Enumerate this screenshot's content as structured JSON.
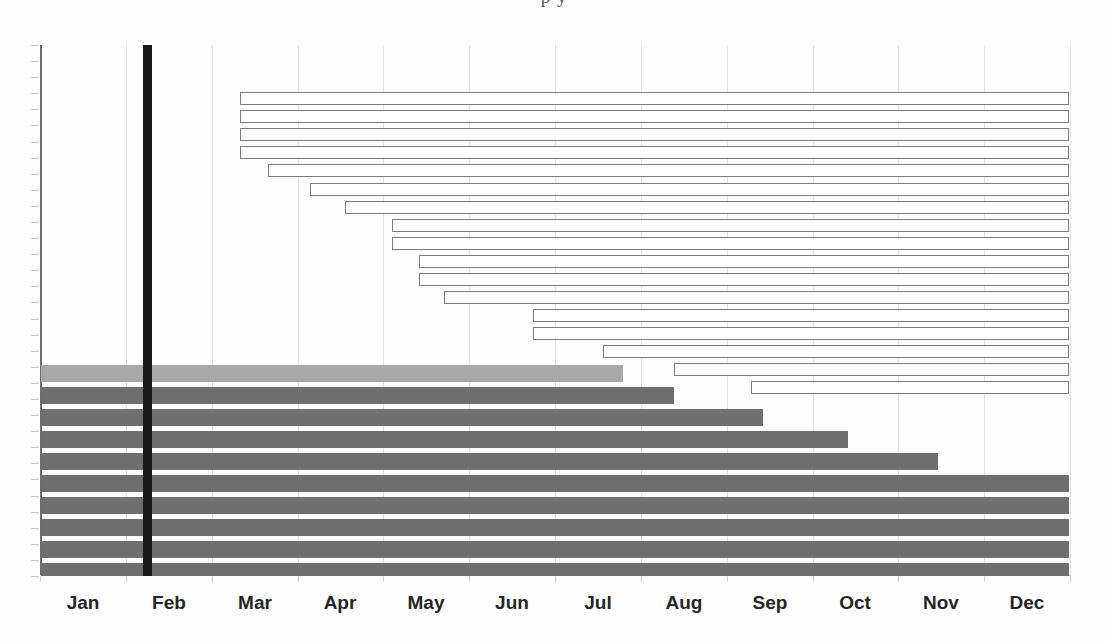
{
  "page": {
    "width": 1108,
    "height": 642,
    "background": "#fefefe",
    "top_text_fragment": "p y"
  },
  "axis": {
    "x_label": "",
    "y_label": "",
    "axis_color": "#6d6d6d",
    "grid_color": "#e2e2e2",
    "plot_left": 40,
    "plot_top": 45,
    "plot_width": 1030,
    "plot_height": 531
  },
  "marker": {
    "name": "status-date-marker",
    "label": "",
    "color": "#191919",
    "month_value": 0.9,
    "x_px": 143,
    "width_px": 9
  },
  "legend": {
    "visible": false,
    "entries": [
      {
        "label": "Planned (baseline)",
        "style": "hollow",
        "color": "#7d7d7d"
      },
      {
        "label": "Actual / progress",
        "style": "filled",
        "color": "#6f6f6f"
      },
      {
        "label": "Completed",
        "style": "filled",
        "color": "#a8a8a8"
      }
    ]
  },
  "chart_data": {
    "type": "bar",
    "orientation": "horizontal",
    "title": "",
    "subtitle": "",
    "xlabel": "",
    "ylabel": "",
    "grid": true,
    "legend_position": "none",
    "xlim": [
      0,
      12
    ],
    "x_tick_labels": [
      "Jan",
      "Feb",
      "Mar",
      "Apr",
      "May",
      "Jun",
      "Jul",
      "Aug",
      "Sep",
      "Oct",
      "Nov",
      "Dec"
    ],
    "x_tick_values": [
      0.5,
      1.5,
      2.5,
      3.5,
      4.5,
      5.5,
      6.5,
      7.5,
      8.5,
      9.5,
      10.5,
      11.5
    ],
    "ylim": [
      0,
      32
    ],
    "y_tick_labels": [],
    "series": [
      {
        "name": "Planned (baseline)",
        "style": "hollow",
        "fill": "#ffffff",
        "stroke": "#7d7d7d",
        "bars": [
          {
            "index": 1,
            "start": 2.33,
            "end": 12.0,
            "duration": 9.67
          },
          {
            "index": 2,
            "start": 2.33,
            "end": 12.0,
            "duration": 9.67
          },
          {
            "index": 3,
            "start": 2.33,
            "end": 12.0,
            "duration": 9.67
          },
          {
            "index": 4,
            "start": 2.33,
            "end": 12.0,
            "duration": 9.67
          },
          {
            "index": 5,
            "start": 2.66,
            "end": 12.0,
            "duration": 9.34
          },
          {
            "index": 6,
            "start": 3.15,
            "end": 12.0,
            "duration": 8.85
          },
          {
            "index": 7,
            "start": 3.56,
            "end": 12.0,
            "duration": 8.44
          },
          {
            "index": 8,
            "start": 4.11,
            "end": 12.0,
            "duration": 7.89
          },
          {
            "index": 9,
            "start": 4.11,
            "end": 12.0,
            "duration": 7.89
          },
          {
            "index": 10,
            "start": 4.42,
            "end": 12.0,
            "duration": 7.58
          },
          {
            "index": 11,
            "start": 4.42,
            "end": 12.0,
            "duration": 7.58
          },
          {
            "index": 12,
            "start": 4.72,
            "end": 12.0,
            "duration": 7.28
          },
          {
            "index": 13,
            "start": 5.76,
            "end": 12.0,
            "duration": 6.24
          },
          {
            "index": 14,
            "start": 5.76,
            "end": 12.0,
            "duration": 6.24
          },
          {
            "index": 15,
            "start": 6.58,
            "end": 12.0,
            "duration": 5.42
          },
          {
            "index": 16,
            "start": 7.4,
            "end": 12.0,
            "duration": 4.6
          },
          {
            "index": 17,
            "start": 8.3,
            "end": 12.0,
            "duration": 3.7
          }
        ]
      },
      {
        "name": "Actual / progress",
        "style": "filled",
        "fill": "#6f6f6f",
        "bars": [
          {
            "index": 1,
            "start": 0.0,
            "end": 6.72,
            "duration": 6.72,
            "color": "#a8a8a8"
          },
          {
            "index": 2,
            "start": 0.0,
            "end": 7.32,
            "duration": 7.32,
            "color": "#6f6f6f"
          },
          {
            "index": 3,
            "start": 0.0,
            "end": 8.35,
            "duration": 8.35,
            "color": "#6f6f6f"
          },
          {
            "index": 4,
            "start": 0.0,
            "end": 9.34,
            "duration": 9.34,
            "color": "#6f6f6f"
          },
          {
            "index": 5,
            "start": 0.0,
            "end": 10.39,
            "duration": 10.39,
            "color": "#6f6f6f"
          },
          {
            "index": 6,
            "start": 0.0,
            "end": 12.0,
            "duration": 12.0,
            "color": "#6f6f6f"
          },
          {
            "index": 7,
            "start": 0.0,
            "end": 12.0,
            "duration": 12.0,
            "color": "#6f6f6f"
          },
          {
            "index": 8,
            "start": 0.0,
            "end": 12.0,
            "duration": 12.0,
            "color": "#6f6f6f"
          },
          {
            "index": 9,
            "start": 0.0,
            "end": 12.0,
            "duration": 12.0,
            "color": "#6f6f6f"
          },
          {
            "index": 10,
            "start": 0.0,
            "end": 12.0,
            "duration": 12.0,
            "color": "#6f6f6f"
          },
          {
            "index": 11,
            "start": 0.0,
            "end": 12.0,
            "duration": 12.0,
            "color": "#6f6f6f"
          },
          {
            "index": 12,
            "start": 0.0,
            "end": 12.0,
            "duration": 12.0,
            "color": "#6f6f6f"
          },
          {
            "index": 13,
            "start": 0.0,
            "end": 12.0,
            "duration": 12.0,
            "color": "#6f6f6f"
          },
          {
            "index": 14,
            "start": 0.0,
            "end": 12.0,
            "duration": 12.0,
            "color": "#6f6f6f"
          },
          {
            "index": 15,
            "start": 0.0,
            "end": 12.0,
            "duration": 12.0,
            "color": "#6f6f6f"
          },
          {
            "index": 16,
            "start": 0.0,
            "end": 12.0,
            "duration": 12.0,
            "color": "#6f6f6f"
          }
        ]
      }
    ]
  },
  "geometry": {
    "hollow_bars_px": [
      {
        "x": 240,
        "y": 92,
        "w": 829,
        "h": 13
      },
      {
        "x": 240,
        "y": 110,
        "w": 829,
        "h": 13
      },
      {
        "x": 240,
        "y": 128,
        "w": 829,
        "h": 13
      },
      {
        "x": 240,
        "y": 146,
        "w": 829,
        "h": 13
      },
      {
        "x": 268,
        "y": 164,
        "w": 801,
        "h": 13
      },
      {
        "x": 310,
        "y": 183,
        "w": 759,
        "h": 13
      },
      {
        "x": 345,
        "y": 201,
        "w": 724,
        "h": 13
      },
      {
        "x": 392,
        "y": 219,
        "w": 677,
        "h": 13
      },
      {
        "x": 392,
        "y": 237,
        "w": 677,
        "h": 13
      },
      {
        "x": 419,
        "y": 255,
        "w": 650,
        "h": 13
      },
      {
        "x": 419,
        "y": 273,
        "w": 650,
        "h": 13
      },
      {
        "x": 444,
        "y": 291,
        "w": 625,
        "h": 13
      },
      {
        "x": 533,
        "y": 309,
        "w": 536,
        "h": 13
      },
      {
        "x": 533,
        "y": 327,
        "w": 536,
        "h": 13
      },
      {
        "x": 603,
        "y": 345,
        "w": 466,
        "h": 13
      },
      {
        "x": 674,
        "y": 363,
        "w": 395,
        "h": 13
      },
      {
        "x": 751,
        "y": 381,
        "w": 318,
        "h": 13
      }
    ],
    "filled_bars_px": [
      {
        "x": 41,
        "y": 365,
        "w": 582,
        "h": 17,
        "color": "#a8a8a8"
      },
      {
        "x": 41,
        "y": 387,
        "w": 633,
        "h": 17,
        "color": "#6f6f6f"
      },
      {
        "x": 41,
        "y": 409,
        "w": 722,
        "h": 17,
        "color": "#6f6f6f"
      },
      {
        "x": 41,
        "y": 431,
        "w": 807,
        "h": 17,
        "color": "#6f6f6f"
      },
      {
        "x": 41,
        "y": 453,
        "w": 897,
        "h": 17,
        "color": "#6f6f6f"
      },
      {
        "x": 41,
        "y": 475,
        "w": 1028,
        "h": 17,
        "color": "#6f6f6f"
      },
      {
        "x": 41,
        "y": 497,
        "w": 1028,
        "h": 17,
        "color": "#6f6f6f"
      },
      {
        "x": 41,
        "y": 519,
        "w": 1028,
        "h": 17,
        "color": "#6f6f6f"
      },
      {
        "x": 41,
        "y": 541,
        "w": 1028,
        "h": 17,
        "color": "#6f6f6f"
      },
      {
        "x": 41,
        "y": 563,
        "w": 1028,
        "h": 13,
        "color": "#6f6f6f"
      }
    ]
  }
}
